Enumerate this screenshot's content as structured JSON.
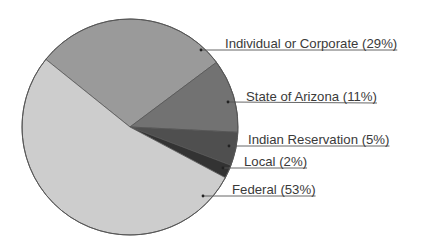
{
  "chart_data": {
    "type": "pie",
    "title": "",
    "start_angle_deg_clockwise_from_top": 308.8,
    "categories": [
      "Individual or Corporate",
      "State of Arizona",
      "Indian Reservation",
      "Local",
      "Federal"
    ],
    "values": [
      29,
      11,
      5,
      2,
      53
    ],
    "labels": [
      "Individual or Corporate (29%)",
      "State of Arizona (11%)",
      "Indian Reservation (5%)",
      "Local (2%)",
      "Federal (53%)"
    ],
    "colors": [
      "#9a9a9a",
      "#727272",
      "#4f4f4f",
      "#333333",
      "#cdcdcd"
    ],
    "legend_position": "right (leader-line labels)",
    "label_anchors": [
      {
        "dot": [
          201,
          50
        ],
        "text_x": 225,
        "line_y": 50
      },
      {
        "dot": [
          228,
          102
        ],
        "text_x": 246,
        "line_y": 103
      },
      {
        "dot": [
          229,
          146
        ],
        "text_x": 248,
        "line_y": 146
      },
      {
        "dot": [
          223,
          168
        ],
        "text_x": 244,
        "line_y": 168
      },
      {
        "dot": [
          203,
          196
        ],
        "text_x": 232,
        "line_y": 196
      }
    ]
  }
}
